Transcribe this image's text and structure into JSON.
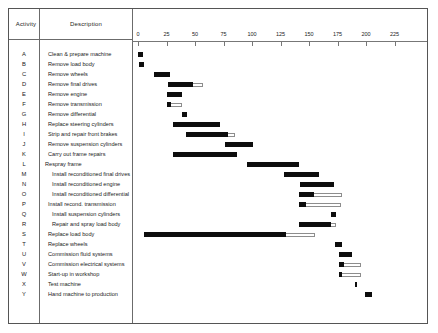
{
  "header": {
    "activity_label": "Activity",
    "description_label": "Description"
  },
  "axis": {
    "ticks": [
      0,
      25,
      50,
      75,
      100,
      125,
      150,
      175,
      200,
      225
    ],
    "min": 0,
    "max": 250,
    "unit_px": 1.14,
    "origin_px": 137
  },
  "chart_data": {
    "type": "bar",
    "title": "",
    "xlabel": "",
    "ylabel": "Activity",
    "xlim": [
      0,
      250
    ],
    "grid": false,
    "legend": null,
    "orientation": "horizontal",
    "categories": [
      "A",
      "B",
      "C",
      "D",
      "E",
      "F",
      "G",
      "H",
      "I",
      "J",
      "K",
      "L",
      "M",
      "N",
      "O",
      "P",
      "Q",
      "R",
      "S",
      "T",
      "U",
      "V",
      "W",
      "X",
      "Y"
    ],
    "rows": [
      {
        "letter": "A",
        "description": "Clean & prepare machine",
        "indent": "none",
        "start": 0,
        "duration": 4,
        "float": 0
      },
      {
        "letter": "B",
        "description": "Remove load body",
        "indent": "none",
        "start": 1,
        "duration": 4,
        "float": 0
      },
      {
        "letter": "C",
        "description": "Remove wheels",
        "indent": "none",
        "start": 14,
        "duration": 14,
        "float": 0
      },
      {
        "letter": "D",
        "description": "Remove final drives",
        "indent": "none",
        "start": 26,
        "duration": 22,
        "float": 9
      },
      {
        "letter": "E",
        "description": "Remove engine",
        "indent": "none",
        "start": 25,
        "duration": 14,
        "float": 0
      },
      {
        "letter": "F",
        "description": "Remove transmission",
        "indent": "none",
        "start": 25,
        "duration": 4,
        "float": 10
      },
      {
        "letter": "G",
        "description": "Remove differential",
        "indent": "none",
        "start": 39,
        "duration": 4,
        "float": 0
      },
      {
        "letter": "H",
        "description": "Replace steering cylinders",
        "indent": "light",
        "start": 31,
        "duration": 41,
        "float": 0
      },
      {
        "letter": "I",
        "description": "Strip and repair front brakes",
        "indent": "none",
        "start": 42,
        "duration": 37,
        "float": 6
      },
      {
        "letter": "J",
        "description": "Remove suspension cylinders",
        "indent": "none",
        "start": 76,
        "duration": 25,
        "float": 0
      },
      {
        "letter": "K",
        "description": "Carry out frame repairs",
        "indent": "none",
        "start": 31,
        "duration": 56,
        "float": 0
      },
      {
        "letter": "L",
        "description": "Respray frame",
        "indent": "outdent",
        "start": 96,
        "duration": 45,
        "float": 0
      },
      {
        "letter": "M",
        "description": "Install reconditioned final drives",
        "indent": "indent",
        "start": 128,
        "duration": 31,
        "float": 0
      },
      {
        "letter": "N",
        "description": "Install reconditioned engine",
        "indent": "indent",
        "start": 142,
        "duration": 30,
        "float": 0
      },
      {
        "letter": "O",
        "description": "Install reconditioned differential",
        "indent": "indent",
        "start": 141,
        "duration": 13,
        "float": 25
      },
      {
        "letter": "P",
        "description": "Install recond. transmission",
        "indent": "light",
        "start": 141,
        "duration": 6,
        "float": 31
      },
      {
        "letter": "Q",
        "description": "Install suspension cylinders",
        "indent": "indent",
        "start": 169,
        "duration": 5,
        "float": 0
      },
      {
        "letter": "R",
        "description": "Repair and spray load body",
        "indent": "indent",
        "start": 141,
        "duration": 28,
        "float": 5
      },
      {
        "letter": "S",
        "description": "Replace load body",
        "indent": "none",
        "start": 5,
        "duration": 125,
        "float": 25
      },
      {
        "letter": "T",
        "description": "Replace wheels",
        "indent": "none",
        "start": 173,
        "duration": 6,
        "float": 0
      },
      {
        "letter": "U",
        "description": "Commission fluid systems",
        "indent": "light",
        "start": 176,
        "duration": 12,
        "float": 0
      },
      {
        "letter": "V",
        "description": "Commission electrical systems",
        "indent": "light",
        "start": 176,
        "duration": 5,
        "float": 15
      },
      {
        "letter": "W",
        "description": "Start-up in workshop",
        "indent": "light",
        "start": 176,
        "duration": 3,
        "float": 17
      },
      {
        "letter": "X",
        "description": "Test machine",
        "indent": "none",
        "start": 190,
        "duration": 2,
        "float": 0
      },
      {
        "letter": "Y",
        "description": "Hand machine to production",
        "indent": "light",
        "start": 199,
        "duration": 6,
        "float": 0
      }
    ]
  },
  "colors": {
    "bar": "#0d0d0d",
    "float_outline": "#8d8d8d",
    "rule": "#6b6b6b",
    "text": "#222222",
    "background": "#ffffff"
  }
}
